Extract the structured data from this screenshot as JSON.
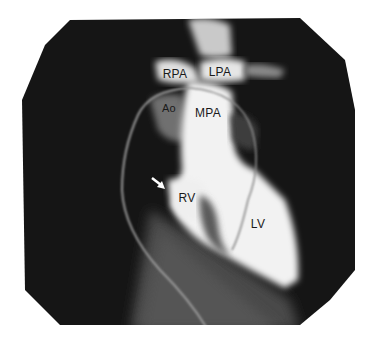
{
  "figure": {
    "type": "angiogram",
    "background": "#ffffff",
    "field_color": "#151515",
    "labels": [
      {
        "id": "rpa",
        "text": "RPA",
        "x": 175,
        "y": 74
      },
      {
        "id": "lpa",
        "text": "LPA",
        "x": 220,
        "y": 72
      },
      {
        "id": "ao",
        "text": "Ao",
        "x": 169,
        "y": 108
      },
      {
        "id": "mpa",
        "text": "MPA",
        "x": 208,
        "y": 113
      },
      {
        "id": "rv",
        "text": "RV",
        "x": 187,
        "y": 198
      },
      {
        "id": "lv",
        "text": "LV",
        "x": 258,
        "y": 224
      }
    ],
    "arrow": {
      "direction": "down-right",
      "color": "#ffffff"
    }
  }
}
